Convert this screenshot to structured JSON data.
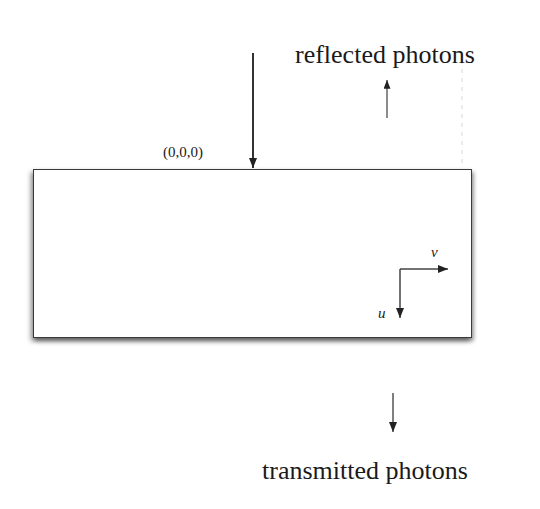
{
  "diagram": {
    "labels": {
      "reflected": "reflected photons",
      "transmitted": "transmitted photons",
      "origin": "(0,0,0)",
      "axis_v": "v",
      "axis_u": "u"
    },
    "elements": {
      "slab": "medium-slab",
      "incident_arrow": "incident-photon-arrow",
      "reflected_arrow": "reflected-photon-arrow",
      "transmitted_arrow": "transmitted-photon-arrow",
      "axes": [
        "u-axis-arrow",
        "v-axis-arrow"
      ]
    },
    "colors": {
      "stroke": "#2a2a2a",
      "background": "#ffffff"
    }
  }
}
